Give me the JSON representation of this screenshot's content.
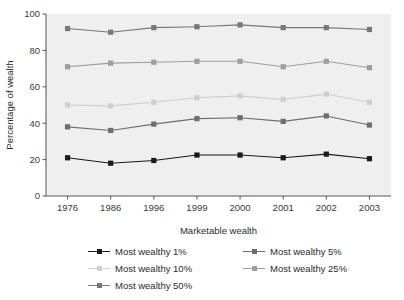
{
  "chart_data": {
    "type": "line",
    "title": "",
    "subtitle": "",
    "xlabel": "Marketable wealth",
    "ylabel": "Percentage of wealth",
    "categories": [
      "1976",
      "1986",
      "1996",
      "1999",
      "2000",
      "2001",
      "2002",
      "2003"
    ],
    "ylim": [
      0,
      100
    ],
    "yticks": [
      0,
      20,
      40,
      60,
      80,
      100
    ],
    "ytick_labels": [
      "0",
      "20",
      "40",
      "60",
      "80",
      "100"
    ],
    "grid": false,
    "legend_position": "below",
    "marker": "square",
    "plot_background": "#efefef",
    "series": [
      {
        "name": "Most wealthy 1%",
        "color": "#1a1a1a",
        "values": [
          21.0,
          18.0,
          19.5,
          22.5,
          22.5,
          21.0,
          23.0,
          20.5
        ]
      },
      {
        "name": "Most wealthy 5%",
        "color": "#6e6e6e",
        "values": [
          38.0,
          36.0,
          39.5,
          42.5,
          43.0,
          41.0,
          44.0,
          39.0
        ]
      },
      {
        "name": "Most wealthy 10%",
        "color": "#cfcfcf",
        "values": [
          50.0,
          49.5,
          51.5,
          54.0,
          55.0,
          53.0,
          56.0,
          51.5
        ]
      },
      {
        "name": "Most wealthy 25%",
        "color": "#9e9e9e",
        "values": [
          71.0,
          73.0,
          73.5,
          74.0,
          74.0,
          71.0,
          74.0,
          70.5
        ]
      },
      {
        "name": "Most wealthy 50%",
        "color": "#787878",
        "values": [
          92.0,
          90.0,
          92.5,
          93.0,
          94.0,
          92.5,
          92.5,
          91.5
        ]
      }
    ]
  },
  "legend": {
    "items": [
      {
        "label": "Most wealthy 1%",
        "color": "#1a1a1a"
      },
      {
        "label": "Most wealthy 5%",
        "color": "#6e6e6e"
      },
      {
        "label": "Most wealthy 10%",
        "color": "#cfcfcf"
      },
      {
        "label": "Most wealthy 25%",
        "color": "#9e9e9e"
      },
      {
        "label": "Most wealthy 50%",
        "color": "#787878"
      }
    ]
  },
  "axes": {
    "x_title": "Marketable wealth",
    "y_title": "Percentage of wealth"
  }
}
